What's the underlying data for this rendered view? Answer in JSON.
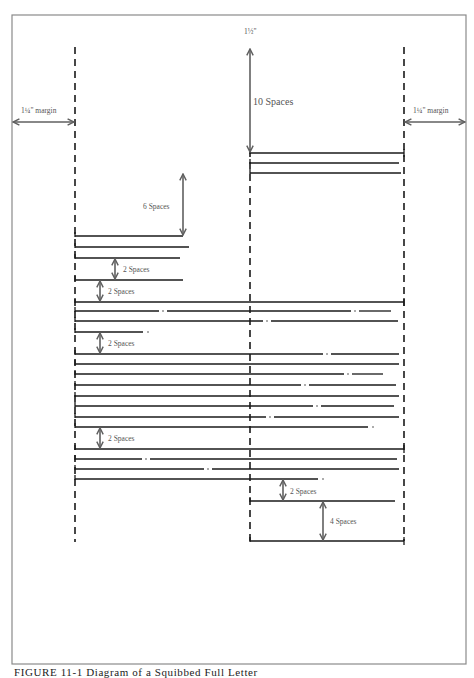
{
  "figure": {
    "caption": "FIGURE 11-1  Diagram of a Squibbed Full Letter",
    "frame": {
      "x": 12,
      "y": 15,
      "w": 454,
      "h": 649
    },
    "colors": {
      "line": "#1a1a1a",
      "arrow": "#606060",
      "frame": "#8a8a8a",
      "label": "#555555"
    }
  },
  "guides": {
    "left_margin_x": 75,
    "right_margin_x": 404,
    "center_x": 250,
    "left_dashed": {
      "y1": 47,
      "y2": 542
    },
    "right_dashed": {
      "y1": 47,
      "y2": 541
    },
    "center_dashed": {
      "y1": 150,
      "y2": 541
    }
  },
  "labels": {
    "top_margin": "1½\"",
    "left_margin": "1¼\" margin",
    "right_margin": "1¼\" margin",
    "ten_spaces": "10 Spaces",
    "six_spaces": "6 Spaces",
    "two_spaces_a": "2 Spaces",
    "two_spaces_b": "2 Spaces",
    "two_spaces_c": "2 Spaces",
    "two_spaces_d": "2 Spaces",
    "two_spaces_e": "2 Spaces",
    "four_spaces": "4 Spaces"
  },
  "text_lines": [
    {
      "y": 153,
      "x1": 250,
      "x2": 404,
      "tick_right": true
    },
    {
      "y": 163,
      "x1": 250,
      "x2": 399
    },
    {
      "y": 173,
      "x1": 250,
      "x2": 401
    },
    {
      "y": 236,
      "x1": 75,
      "x2": 183
    },
    {
      "y": 247,
      "x1": 75,
      "x2": 189
    },
    {
      "y": 258,
      "x1": 75,
      "x2": 180
    },
    {
      "y": 280,
      "x1": 75,
      "x2": 183
    },
    {
      "y": 302,
      "x1": 75,
      "x2": 404,
      "tick_right": true
    },
    {
      "y": 311,
      "x1": 75,
      "x2": 391,
      "gaps": [
        163,
        355
      ]
    },
    {
      "y": 321,
      "x1": 75,
      "x2": 398,
      "gaps": [
        267
      ]
    },
    {
      "y": 332,
      "x1": 75,
      "x2": 143,
      "dot_end": true
    },
    {
      "y": 354,
      "x1": 75,
      "x2": 399,
      "gaps": [
        327
      ]
    },
    {
      "y": 364,
      "x1": 75,
      "x2": 399
    },
    {
      "y": 374,
      "x1": 75,
      "x2": 383,
      "gaps": [
        348
      ]
    },
    {
      "y": 385,
      "x1": 75,
      "x2": 396,
      "gaps": [
        305
      ]
    },
    {
      "y": 396,
      "x1": 75,
      "x2": 399
    },
    {
      "y": 406,
      "x1": 75,
      "x2": 394,
      "gaps": [
        317
      ]
    },
    {
      "y": 417,
      "x1": 75,
      "x2": 399,
      "gaps": [
        270
      ]
    },
    {
      "y": 427,
      "x1": 75,
      "x2": 368,
      "dot_end": true
    },
    {
      "y": 449,
      "x1": 75,
      "x2": 404,
      "tick_right": true
    },
    {
      "y": 459,
      "x1": 75,
      "x2": 397,
      "gaps": [
        146
      ]
    },
    {
      "y": 469,
      "x1": 75,
      "x2": 399,
      "gaps": [
        208
      ]
    },
    {
      "y": 479,
      "x1": 75,
      "x2": 318,
      "dot_end": true
    },
    {
      "y": 501,
      "x1": 250,
      "x2": 395
    },
    {
      "y": 541,
      "x1": 250,
      "x2": 404,
      "tick_right": true
    }
  ],
  "arrows": [
    {
      "id": "left-margin",
      "x1": 13,
      "y1": 122,
      "x2": 74,
      "y2": 122,
      "label_key": "left_margin"
    },
    {
      "id": "right-margin",
      "x1": 405,
      "y1": 122,
      "x2": 465,
      "y2": 122,
      "label_key": "right_margin"
    },
    {
      "id": "ten-spaces",
      "x1": 250,
      "y1": 49,
      "x2": 250,
      "y2": 152,
      "label_key": "ten_spaces"
    },
    {
      "id": "six-spaces",
      "x1": 183,
      "y1": 174,
      "x2": 183,
      "y2": 235,
      "label_key": "six_spaces"
    },
    {
      "id": "two-spaces-a",
      "x1": 115,
      "y1": 259,
      "x2": 115,
      "y2": 279,
      "label_key": "two_spaces_a"
    },
    {
      "id": "two-spaces-b",
      "x1": 100,
      "y1": 281,
      "x2": 100,
      "y2": 301,
      "label_key": "two_spaces_b"
    },
    {
      "id": "two-spaces-c",
      "x1": 100,
      "y1": 333,
      "x2": 100,
      "y2": 353,
      "label_key": "two_spaces_c"
    },
    {
      "id": "two-spaces-d",
      "x1": 100,
      "y1": 428,
      "x2": 100,
      "y2": 448,
      "label_key": "two_spaces_d"
    },
    {
      "id": "two-spaces-e",
      "x1": 283,
      "y1": 480,
      "x2": 283,
      "y2": 500,
      "label_key": "two_spaces_e"
    },
    {
      "id": "four-spaces",
      "x1": 323,
      "y1": 502,
      "x2": 323,
      "y2": 540,
      "label_key": "four_spaces"
    }
  ]
}
